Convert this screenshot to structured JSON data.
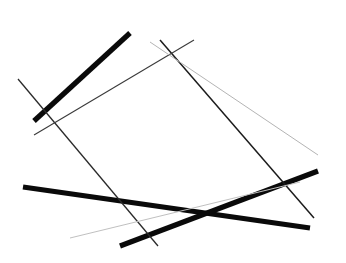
{
  "figure": {
    "background_color": "#ffffff",
    "width": 346,
    "height": 263
  },
  "chart_data": {
    "type": "line",
    "subtitle": "",
    "xlabel": "",
    "ylabel": "",
    "xlim": [
      0,
      346
    ],
    "ylim": [
      0,
      263
    ],
    "grid": false,
    "legend": "none",
    "background_color": "#ffffff",
    "note": "Eight straight line segments of varying stroke width and gray value drawn on a plain white field. Coordinates are in pixels with origin at top-left.",
    "series": [
      {
        "name": "segment-1-thick-upper-left-diagonal",
        "x": [
          130,
          34
        ],
        "y": [
          33,
          121
        ],
        "color": "#0a0a0a",
        "width": 5.2,
        "opacity": 1.0
      },
      {
        "name": "segment-2-thick-lower-descending",
        "x": [
          23,
          310
        ],
        "y": [
          187,
          228
        ],
        "color": "#0a0a0a",
        "width": 5.2,
        "opacity": 1.0
      },
      {
        "name": "segment-3-thick-lower-ascending",
        "x": [
          120,
          318
        ],
        "y": [
          246,
          171
        ],
        "color": "#0a0a0a",
        "width": 5.2,
        "opacity": 1.0
      },
      {
        "name": "segment-4-thin-long-right-diagonal",
        "x": [
          160,
          314
        ],
        "y": [
          40,
          218
        ],
        "color": "#1c1c1c",
        "width": 1.5,
        "opacity": 1.0
      },
      {
        "name": "segment-5-thin-left-diagonal",
        "x": [
          18,
          158
        ],
        "y": [
          79,
          246
        ],
        "color": "#2a2a2a",
        "width": 1.3,
        "opacity": 1.0
      },
      {
        "name": "segment-6-thin-upper-right-to-mid-left",
        "x": [
          194,
          34
        ],
        "y": [
          40,
          135
        ],
        "color": "#3a3a3a",
        "width": 1.1,
        "opacity": 1.0
      },
      {
        "name": "segment-7-light-upper-right-shallow",
        "x": [
          150,
          318
        ],
        "y": [
          42,
          155
        ],
        "color": "#b4b4b4",
        "width": 1.0,
        "opacity": 1.0
      },
      {
        "name": "segment-8-light-lower-shallow",
        "x": [
          70,
          300
        ],
        "y": [
          238,
          182
        ],
        "color": "#c0c0c0",
        "width": 1.0,
        "opacity": 1.0
      }
    ]
  }
}
